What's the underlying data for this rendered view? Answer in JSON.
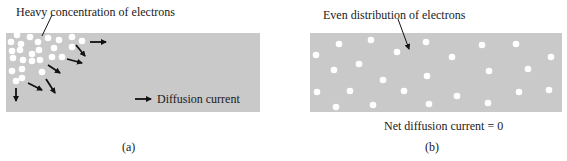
{
  "colors": {
    "panel": "#c9c9c9",
    "dot": "#ffffff",
    "arrow": "#111111",
    "text": "#1a1a1a"
  },
  "panel_a": {
    "label": "(a)",
    "annotation": "Heavy concentration of electrons",
    "legend": "Diffusion current",
    "rect": {
      "x": 6,
      "y": 33,
      "w": 254,
      "h": 79
    },
    "dots": [
      [
        17,
        35
      ],
      [
        30,
        37
      ],
      [
        38,
        42
      ],
      [
        48,
        38
      ],
      [
        59,
        40
      ],
      [
        72,
        37
      ],
      [
        82,
        41
      ],
      [
        11,
        42
      ],
      [
        21,
        44
      ],
      [
        39,
        50
      ],
      [
        54,
        48
      ],
      [
        72,
        47
      ],
      [
        12,
        51
      ],
      [
        20,
        50
      ],
      [
        32,
        54
      ],
      [
        40,
        60
      ],
      [
        52,
        57
      ],
      [
        62,
        57
      ],
      [
        13,
        58
      ],
      [
        23,
        60
      ],
      [
        32,
        61
      ],
      [
        42,
        72
      ],
      [
        12,
        71
      ],
      [
        22,
        69
      ],
      [
        16,
        81
      ],
      [
        22,
        78
      ]
    ],
    "arrows": [
      [
        90,
        42,
        106,
        42
      ],
      [
        76,
        45,
        85,
        56
      ],
      [
        67,
        59,
        82,
        63
      ],
      [
        48,
        65,
        60,
        73
      ],
      [
        46,
        79,
        55,
        93
      ],
      [
        28,
        83,
        42,
        90
      ],
      [
        16,
        88,
        16,
        101
      ]
    ],
    "legend_arrow": [
      135,
      99,
      151,
      99
    ]
  },
  "panel_b": {
    "label": "(b)",
    "annotation": "Even distribution of electrons",
    "caption": "Net diffusion current = 0",
    "rect": {
      "x": 310,
      "y": 33,
      "w": 252,
      "h": 79
    },
    "dots": [
      [
        316,
        55
      ],
      [
        339,
        44
      ],
      [
        371,
        40
      ],
      [
        397,
        52
      ],
      [
        426,
        42
      ],
      [
        452,
        57
      ],
      [
        482,
        45
      ],
      [
        516,
        44
      ],
      [
        551,
        57
      ],
      [
        334,
        70
      ],
      [
        359,
        64
      ],
      [
        383,
        80
      ],
      [
        427,
        76
      ],
      [
        489,
        71
      ],
      [
        528,
        69
      ],
      [
        317,
        92
      ],
      [
        350,
        91
      ],
      [
        404,
        91
      ],
      [
        457,
        96
      ],
      [
        519,
        92
      ],
      [
        549,
        90
      ],
      [
        336,
        107
      ],
      [
        373,
        105
      ],
      [
        429,
        104
      ],
      [
        488,
        103
      ]
    ]
  }
}
